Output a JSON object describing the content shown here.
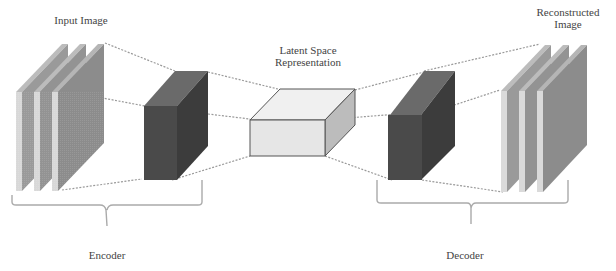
{
  "diagram": {
    "labels": {
      "input": "Input Image",
      "latent_line1": "Latent Space",
      "latent_line2": "Representation",
      "output_line1": "Reconstructed",
      "output_line2": "Image",
      "encoder": "Encoder",
      "decoder": "Decoder"
    },
    "components": [
      {
        "id": "input-image",
        "type": "stacked-slabs",
        "count": 3,
        "color": "#8a8a8a"
      },
      {
        "id": "encoder-block",
        "type": "cuboid",
        "color": "#4a4a4a"
      },
      {
        "id": "latent-block",
        "type": "cuboid",
        "color": "#e6e6e6"
      },
      {
        "id": "decoder-block",
        "type": "cuboid",
        "color": "#4a4a4a"
      },
      {
        "id": "reconstructed-image",
        "type": "stacked-slabs",
        "count": 3,
        "color": "#8a8a8a"
      }
    ],
    "groups": [
      {
        "id": "encoder",
        "label": "Encoder",
        "spans": [
          "input-image",
          "encoder-block"
        ]
      },
      {
        "id": "decoder",
        "label": "Decoder",
        "spans": [
          "decoder-block",
          "reconstructed-image"
        ]
      }
    ],
    "colors": {
      "slab_face": "#8c8c8c",
      "slab_edge": "#d8d8d8",
      "dark_block_front": "#4a4a4a",
      "dark_block_side": "#3a3a3a",
      "dark_block_top": "#666666",
      "latent_front": "#e8e8e8",
      "latent_side": "#bdbdbd",
      "latent_top": "#f2f2f2",
      "connector": "#9a9a9a",
      "bracket": "#aaaaaa",
      "text": "#444444"
    }
  }
}
